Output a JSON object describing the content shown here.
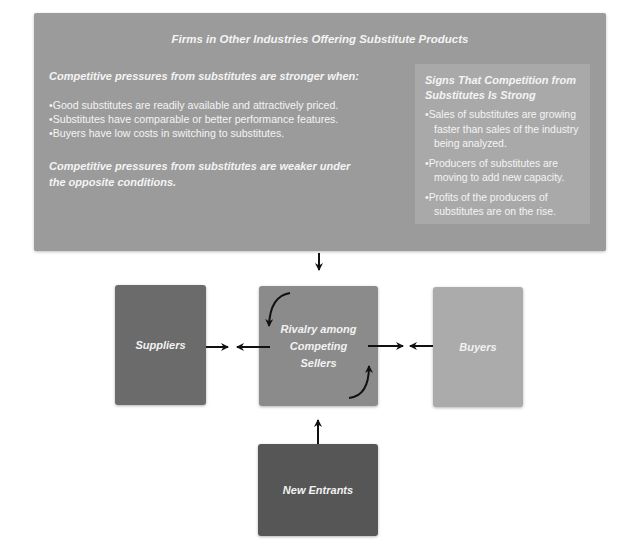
{
  "substitutes": {
    "title": "Firms in Other Industries Offering Substitute Products",
    "stronger_heading": "Competitive pressures from substitutes are stronger when:",
    "stronger_conditions": [
      "Good substitutes are readily available and attractively priced.",
      "Substitutes have comparable or better performance features.",
      "Buyers have low costs in switching to substitutes."
    ],
    "weaker_note": "Competitive pressures from substitutes are weaker under the opposite conditions.",
    "signs": {
      "heading": "Signs That Competition from Substitutes Is Strong",
      "items": [
        "Sales of substitutes are growing faster than sales of the industry being analyzed.",
        "Producers of substitutes are moving to add new capacity.",
        "Profits of the producers of substitutes are on the rise."
      ]
    }
  },
  "forces": {
    "suppliers": "Suppliers",
    "rivalry": "Rivalry among Competing Sellers",
    "buyers": "Buyers",
    "new_entrants": "New Entrants"
  },
  "colors": {
    "substitutes_box": "#9b9b9b",
    "signs_box": "#a9a9a9",
    "suppliers": "#6b6b6b",
    "rivalry": "#8b8b8b",
    "buyers": "#ababab",
    "new_entrants": "#565656",
    "arrow": "#111111"
  }
}
